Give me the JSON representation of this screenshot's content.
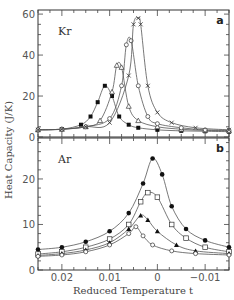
{
  "figure": {
    "ylabel": "Heat Capacity (J/K)",
    "xlabel": "Reduced Temperature t",
    "x_ticks": [
      "0.02",
      "0.01",
      "0",
      "−0.01"
    ]
  },
  "panels": [
    {
      "id": "a",
      "label": "a",
      "gas": "Kr",
      "y_ticks": [
        "0",
        "20",
        "40",
        "60"
      ]
    },
    {
      "id": "b",
      "label": "b",
      "gas": "Ar",
      "y_ticks": [
        "0",
        "10",
        "20"
      ]
    }
  ],
  "chart_data": [
    {
      "type": "line",
      "title": "Kr",
      "panel": "a",
      "xlabel": "Reduced Temperature t",
      "ylabel": "Heat Capacity (J/K)",
      "xlim": [
        0.025,
        -0.015
      ],
      "ylim": [
        0,
        62
      ],
      "y_ticks": [
        0,
        20,
        40,
        60
      ],
      "x_ticks": [
        0.02,
        0.01,
        0,
        -0.01
      ],
      "grid": false,
      "legend": "none",
      "series": [
        {
          "name": "filled squares",
          "marker": "filled-square",
          "x": [
            0.025,
            0.02,
            0.016,
            0.014,
            0.0125,
            0.011,
            0.0095,
            0.008,
            0.006,
            0.004,
            0.0,
            -0.005,
            -0.01,
            -0.015
          ],
          "y": [
            3.5,
            3.8,
            6,
            10,
            17,
            25,
            20,
            10,
            6,
            4.5,
            3.5,
            3,
            2.8,
            2.6
          ]
        },
        {
          "name": "triangles",
          "marker": "open-triangle",
          "x": [
            0.025,
            0.02,
            0.015,
            0.012,
            0.0095,
            0.0085,
            0.0075,
            0.006,
            0.004,
            0.0,
            -0.005,
            -0.01,
            -0.015
          ],
          "y": [
            3.5,
            3.8,
            5,
            8,
            22,
            35,
            34,
            15,
            8,
            5,
            3.8,
            3.2,
            3
          ]
        },
        {
          "name": "open circles",
          "marker": "open-circle",
          "x": [
            0.025,
            0.02,
            0.015,
            0.01,
            0.0075,
            0.0065,
            0.0055,
            0.004,
            0.002,
            0.0,
            -0.005,
            -0.01,
            -0.015
          ],
          "y": [
            3.5,
            3.8,
            5,
            9,
            25,
            45,
            47,
            25,
            10,
            6.5,
            4.5,
            3.5,
            3.2
          ]
        },
        {
          "name": "crosses",
          "marker": "cross",
          "x": [
            0.025,
            0.02,
            0.015,
            0.01,
            0.006,
            0.005,
            0.004,
            0.0035,
            0.002,
            0.0,
            -0.003,
            -0.008,
            -0.015
          ],
          "y": [
            3.5,
            3.8,
            5,
            7,
            30,
            55,
            58,
            55,
            25,
            12,
            7,
            4.5,
            3.5
          ]
        }
      ]
    },
    {
      "type": "line",
      "title": "Ar",
      "panel": "b",
      "xlabel": "Reduced Temperature t",
      "ylabel": "Heat Capacity (J/K)",
      "xlim": [
        0.025,
        -0.015
      ],
      "ylim": [
        0,
        29
      ],
      "y_ticks": [
        0,
        10,
        20
      ],
      "x_ticks": [
        0.02,
        0.01,
        0,
        -0.01
      ],
      "grid": false,
      "legend": "none",
      "series": [
        {
          "name": "filled circles",
          "marker": "filled-circle",
          "x": [
            0.025,
            0.02,
            0.015,
            0.01,
            0.006,
            0.003,
            0.001,
            -0.001,
            -0.003,
            -0.006,
            -0.01,
            -0.015
          ],
          "y": [
            4.5,
            5,
            6.2,
            8.5,
            12.5,
            19,
            24.5,
            21,
            14,
            9,
            6.5,
            5
          ]
        },
        {
          "name": "open squares",
          "marker": "open-square",
          "x": [
            0.025,
            0.02,
            0.015,
            0.01,
            0.006,
            0.0035,
            0.002,
            0.0,
            -0.003,
            -0.006,
            -0.01,
            -0.015
          ],
          "y": [
            3.5,
            4,
            5,
            6.8,
            10,
            15,
            17,
            16,
            10,
            7,
            5,
            4
          ]
        },
        {
          "name": "filled triangles",
          "marker": "filled-triangle",
          "x": [
            0.025,
            0.02,
            0.015,
            0.01,
            0.006,
            0.0035,
            0.002,
            0.0,
            -0.004,
            -0.008,
            -0.015
          ],
          "y": [
            3.2,
            3.6,
            4.4,
            6,
            9,
            12,
            11,
            8.5,
            5.5,
            4.2,
            3.6
          ]
        },
        {
          "name": "open circles",
          "marker": "open-circle",
          "x": [
            0.025,
            0.02,
            0.015,
            0.01,
            0.006,
            0.0045,
            0.003,
            0.001,
            -0.003,
            -0.008,
            -0.015
          ],
          "y": [
            3,
            3.3,
            4,
            5.5,
            8,
            9.5,
            7.5,
            5.5,
            4.2,
            3.6,
            3.3
          ]
        }
      ]
    }
  ]
}
